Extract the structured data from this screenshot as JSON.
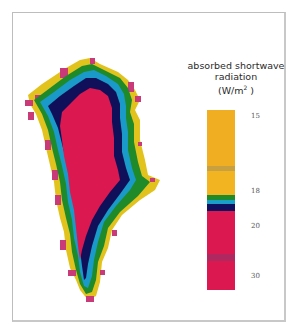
{
  "chart_data": {
    "type": "heatmap",
    "title": "absorbed shortwave radiation",
    "legend_title_line1": "absorbed shortwave",
    "legend_title_line2": "radiation",
    "units_prefix": "(W/m",
    "units_sup": "2",
    "units_suffix": " )",
    "colorbar": {
      "ticks": [
        {
          "label": "15",
          "y": 112
        },
        {
          "label": "18",
          "y": 187
        },
        {
          "label": "20",
          "y": 222
        },
        {
          "label": "30",
          "y": 272
        }
      ],
      "segments": [
        {
          "color": "#F0AE22",
          "from": 0,
          "to": 0.31
        },
        {
          "color": "#C8A040",
          "from": 0.31,
          "to": 0.34
        },
        {
          "color": "#F2B420",
          "from": 0.34,
          "to": 0.47
        },
        {
          "color": "#1E8A2A",
          "from": 0.47,
          "to": 0.5
        },
        {
          "color": "#1AA0C8",
          "from": 0.5,
          "to": 0.52
        },
        {
          "color": "#101060",
          "from": 0.52,
          "to": 0.56
        },
        {
          "color": "#DC1850",
          "from": 0.56,
          "to": 0.8
        },
        {
          "color": "#B02860",
          "from": 0.8,
          "to": 0.84
        },
        {
          "color": "#DC1850",
          "from": 0.84,
          "to": 1
        }
      ]
    }
  },
  "colors": {
    "coast": "#E2C21C",
    "coast_spots": "#C83A78",
    "green": "#1E8A2A",
    "cyan": "#1A9AC8",
    "navy": "#10105A",
    "interior": "#DC1850"
  }
}
